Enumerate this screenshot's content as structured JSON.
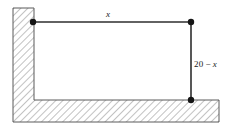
{
  "figure": {
    "name": "corner-wall-rectangle-diagram",
    "colors": {
      "outline": "#555555",
      "hatch": "#8a8a8a",
      "rectangle_line": "#333333",
      "vertex_dot": "#1a1a1a",
      "background": "#ffffff"
    },
    "labels": {
      "horizontal": {
        "text": "x",
        "parts": {
          "variable": "x"
        }
      },
      "vertical": {
        "text": "20 − x",
        "parts": {
          "constant": "20",
          "operator": "−",
          "variable": "x"
        }
      }
    },
    "vertices": [
      {
        "name": "top-left-vertex",
        "x": 33,
        "y": 22
      },
      {
        "name": "top-right-vertex",
        "x": 191,
        "y": 22
      },
      {
        "name": "bottom-right-vertex",
        "x": 191,
        "y": 100
      }
    ],
    "geometry": {
      "wall_outer": {
        "left": 13,
        "top": 8,
        "right": 219,
        "bottom": 122
      },
      "wall_inner_corner": {
        "x": 34,
        "y": 100
      },
      "rectangle": {
        "left": 33,
        "top": 22,
        "right": 191,
        "bottom": 100
      }
    }
  }
}
